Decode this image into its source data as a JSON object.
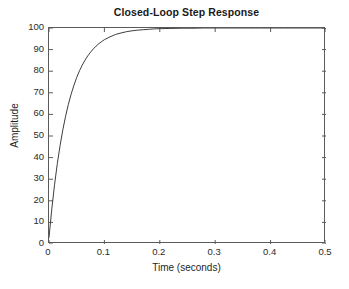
{
  "chart_data": {
    "type": "line",
    "title": "Closed-Loop Step Response",
    "xlabel": "Time (seconds)",
    "ylabel": "Amplitude",
    "xlim": [
      0,
      0.5
    ],
    "ylim": [
      0,
      100
    ],
    "grid": false,
    "legend": null,
    "xticks": [
      "0",
      "0.1",
      "0.2",
      "0.3",
      "0.4",
      "0.5"
    ],
    "xtick_values": [
      0,
      0.1,
      0.2,
      0.3,
      0.4,
      0.5
    ],
    "yticks": [
      "0",
      "10",
      "20",
      "30",
      "40",
      "50",
      "60",
      "70",
      "80",
      "90",
      "100"
    ],
    "ytick_values": [
      0,
      10,
      20,
      30,
      40,
      50,
      60,
      70,
      80,
      90,
      100
    ],
    "line_color": "#3d3d3d",
    "series": [
      {
        "name": "Step response",
        "x": [
          0.0,
          0.005,
          0.01,
          0.015,
          0.02,
          0.025,
          0.03,
          0.035,
          0.04,
          0.045,
          0.05,
          0.055,
          0.06,
          0.065,
          0.07,
          0.075,
          0.08,
          0.085,
          0.09,
          0.095,
          0.1,
          0.11,
          0.12,
          0.13,
          0.14,
          0.15,
          0.16,
          0.17,
          0.18,
          0.19,
          0.2,
          0.22,
          0.24,
          0.26,
          0.28,
          0.3,
          0.32,
          0.34,
          0.36,
          0.38,
          0.4,
          0.425,
          0.45,
          0.475,
          0.5
        ],
        "y": [
          3.0,
          16.1,
          27.4,
          37.2,
          45.6,
          52.9,
          59.2,
          64.7,
          69.4,
          73.5,
          77.1,
          80.2,
          82.8,
          85.1,
          87.1,
          88.8,
          90.3,
          91.6,
          92.8,
          93.7,
          94.6,
          95.9,
          97.0,
          97.7,
          98.3,
          98.7,
          99.0,
          99.2,
          99.4,
          99.6,
          99.7,
          99.8,
          99.9,
          99.9,
          100.0,
          100.0,
          100.0,
          100.0,
          100.0,
          100.0,
          100.0,
          100.0,
          100.0,
          100.0,
          100.0
        ]
      }
    ]
  }
}
